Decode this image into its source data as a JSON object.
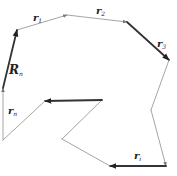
{
  "diagram": {
    "type": "vector-polygon",
    "colors": {
      "thin_line": "#9a9a9a",
      "bold_line": "#333333",
      "label": "#222222",
      "background": "#ffffff"
    },
    "vertices": {
      "A": [
        17,
        30
      ],
      "B": [
        67,
        15
      ],
      "C": [
        127,
        22
      ],
      "D": [
        169,
        60
      ],
      "E": [
        151,
        110
      ],
      "F": [
        166,
        166
      ],
      "G": [
        110,
        166
      ],
      "H": [
        62,
        139
      ],
      "I": [
        102,
        100
      ],
      "J": [
        45,
        101
      ],
      "K": [
        3,
        140
      ],
      "L": [
        3,
        88
      ]
    },
    "segments": [
      {
        "name": "r1",
        "from": "A",
        "to": "B",
        "bold": false,
        "arrow": true
      },
      {
        "name": "r2",
        "from": "B",
        "to": "C",
        "bold": false,
        "arrow": true
      },
      {
        "name": "r3",
        "from": "C",
        "to": "D",
        "bold": true,
        "arrow": true
      },
      {
        "name": "seg-d-e",
        "from": "D",
        "to": "E",
        "bold": false,
        "arrow": false
      },
      {
        "name": "seg-e-f",
        "from": "E",
        "to": "F",
        "bold": false,
        "arrow": true
      },
      {
        "name": "ri",
        "from": "F",
        "to": "G",
        "bold": true,
        "arrow": true
      },
      {
        "name": "seg-g-h",
        "from": "G",
        "to": "H",
        "bold": false,
        "arrow": false
      },
      {
        "name": "seg-h-i",
        "from": "H",
        "to": "I",
        "bold": false,
        "arrow": false
      },
      {
        "name": "seg-i-j",
        "from": "I",
        "to": "J",
        "bold": true,
        "arrow": true
      },
      {
        "name": "seg-j-k",
        "from": "J",
        "to": "K",
        "bold": false,
        "arrow": false
      },
      {
        "name": "rn",
        "from": "K",
        "to": "L",
        "bold": false,
        "arrow": true
      },
      {
        "name": "Rn",
        "from": "L",
        "to": "A",
        "bold": true,
        "arrow": true
      }
    ],
    "labels": {
      "r1": {
        "base": "r",
        "sub": "1",
        "x": 33,
        "y": 13
      },
      "r2": {
        "base": "r",
        "sub": "2",
        "x": 96,
        "y": 6
      },
      "r3": {
        "base": "r",
        "sub": "3",
        "x": 157,
        "y": 39
      },
      "ri": {
        "base": "r",
        "sub": "i",
        "x": 134,
        "y": 151
      },
      "rn": {
        "base": "r",
        "sub": "n",
        "x": 8,
        "y": 106
      },
      "Rn": {
        "base": "R",
        "sub": "n",
        "x": 9,
        "y": 64
      }
    }
  }
}
